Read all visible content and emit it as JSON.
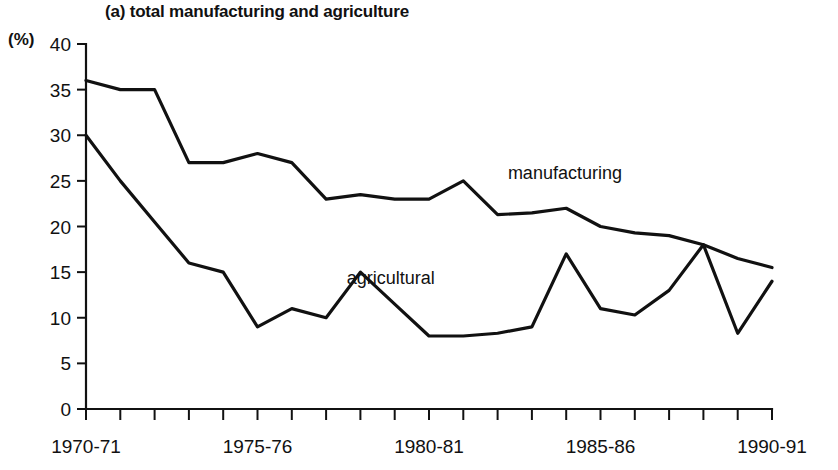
{
  "figure": {
    "title": "(a) total manufacturing and agriculture",
    "unit_label": "(%)"
  },
  "chart_data": {
    "type": "line",
    "title": "(a) total manufacturing and agriculture",
    "xlabel": "",
    "ylabel": "(%)",
    "ylim": [
      0,
      40
    ],
    "ytick_values": [
      0,
      5,
      10,
      15,
      20,
      25,
      30,
      35,
      40
    ],
    "ytick_labels": [
      "0",
      "5",
      "10",
      "15",
      "20",
      "25",
      "30",
      "35",
      "40"
    ],
    "grid": false,
    "legend": "inline annotations next to lines",
    "x": [
      "1970-71",
      "1971-72",
      "1972-73",
      "1973-74",
      "1974-75",
      "1975-76",
      "1976-77",
      "1977-78",
      "1978-79",
      "1979-80",
      "1980-81",
      "1981-82",
      "1982-83",
      "1983-84",
      "1984-85",
      "1985-86",
      "1986-87",
      "1987-88",
      "1988-89",
      "1989-90",
      "1990-91"
    ],
    "xtick_labels_shown": [
      "1970-71",
      "1975-76",
      "1980-81",
      "1985-86",
      "1990-91"
    ],
    "xtick_label_indices": [
      0,
      5,
      10,
      15,
      20
    ],
    "series": [
      {
        "name": "manufacturing",
        "annotation": "manufacturing",
        "annotation_x_index": 12.3,
        "annotation_y": 25.2,
        "values": [
          36,
          35,
          35,
          27,
          27,
          28,
          27,
          23,
          23.5,
          23,
          23,
          25,
          21.3,
          21.5,
          22,
          20,
          19.3,
          19,
          18,
          16.5,
          15.5
        ]
      },
      {
        "name": "agricultural",
        "annotation": "agricultural",
        "annotation_x_index": 7.6,
        "annotation_y": 13.7,
        "values": [
          30,
          25,
          20.5,
          16,
          15,
          9,
          11,
          10,
          15,
          11.5,
          8,
          8,
          8.3,
          9,
          17,
          11,
          10.3,
          13,
          18,
          8.3,
          14
        ]
      }
    ]
  }
}
